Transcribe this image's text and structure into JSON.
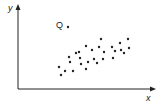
{
  "chart_data": {
    "type": "scatter",
    "title": "",
    "xlabel": "x",
    "ylabel": "y",
    "grid": false,
    "legend": null,
    "annotations": [
      {
        "label": "Q",
        "description": "outlier point",
        "x": 68,
        "y": 27
      }
    ],
    "points_px": [
      [
        59,
        67
      ],
      [
        61,
        75
      ],
      [
        65,
        71
      ],
      [
        69,
        57
      ],
      [
        70,
        62
      ],
      [
        73,
        71
      ],
      [
        76,
        53
      ],
      [
        79,
        52
      ],
      [
        80,
        58
      ],
      [
        81,
        64
      ],
      [
        86,
        46
      ],
      [
        86,
        69
      ],
      [
        88,
        62
      ],
      [
        92,
        50
      ],
      [
        94,
        59
      ],
      [
        97,
        63
      ],
      [
        99,
        47
      ],
      [
        101,
        39
      ],
      [
        103,
        59
      ],
      [
        104,
        52
      ],
      [
        112,
        47
      ],
      [
        113,
        58
      ],
      [
        115,
        51
      ],
      [
        120,
        43
      ],
      [
        121,
        50
      ],
      [
        124,
        53
      ],
      [
        128,
        39
      ],
      [
        129,
        48
      ]
    ],
    "outlier_px": [
      68,
      27
    ],
    "axis": {
      "origin": [
        18,
        89
      ],
      "x_end": [
        156,
        89
      ],
      "y_end": [
        18,
        5
      ]
    }
  },
  "labels": {
    "x_axis": "x",
    "y_axis": "y",
    "outlier": "Q"
  }
}
